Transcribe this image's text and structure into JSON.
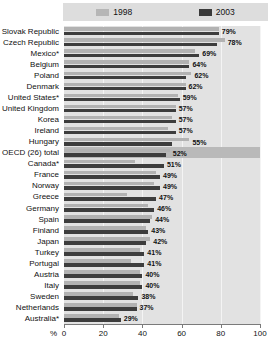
{
  "legend": {
    "entries": [
      {
        "label": "1998",
        "color": "#b2b2b2",
        "icon": "legend-swatch-1998"
      },
      {
        "label": "2003",
        "color": "#3d3d3d",
        "icon": "legend-swatch-2003"
      }
    ]
  },
  "axis": {
    "unit_symbol": "%",
    "ticks": [
      "0",
      "20",
      "40",
      "60",
      "80",
      "100"
    ],
    "tick_values": [
      0,
      20,
      40,
      60,
      80,
      100
    ]
  },
  "chart_data": {
    "type": "bar",
    "orientation": "horizontal",
    "title": "",
    "subtitle": "",
    "xlabel": "%",
    "ylabel": "",
    "xlim": [
      0,
      100
    ],
    "grid": true,
    "legend_position": "top",
    "categories": [
      "Slovak Republic",
      "Czech Republic",
      "Mexico*",
      "Belgium",
      "Poland",
      "Denmark",
      "United States*",
      "United Kingdom",
      "Korea",
      "Ireland",
      "Hungary",
      "OECD (26) total",
      "Canada*",
      "France",
      "Norway",
      "Greece",
      "Germany",
      "Spain",
      "Finland",
      "Japan",
      "Turkey",
      "Portugal",
      "Austria",
      "Italy",
      "Sweden",
      "Netherlands",
      "Australia*"
    ],
    "highlight_category": "OECD (26) total",
    "series": [
      {
        "name": "1998",
        "color": "#b2b2b2",
        "values": [
          79,
          82,
          67,
          64,
          65,
          62,
          58,
          57,
          55,
          53,
          64,
          54,
          36,
          47,
          46,
          32,
          43,
          45,
          42,
          44,
          39,
          34,
          39,
          39,
          35,
          37,
          28
        ]
      },
      {
        "name": "2003",
        "color": "#3d3d3d",
        "values": [
          79,
          78,
          69,
          64,
          62,
          62,
          59,
          57,
          57,
          57,
          55,
          52,
          51,
          49,
          49,
          47,
          46,
          44,
          43,
          42,
          41,
          41,
          40,
          40,
          38,
          37,
          29
        ]
      }
    ],
    "data_labels": [
      "79%",
      "78%",
      "69%",
      "64%",
      "62%",
      "62%",
      "59%",
      "57%",
      "57%",
      "57%",
      "55%",
      "52%",
      "51%",
      "49%",
      "49%",
      "47%",
      "46%",
      "44%",
      "43%",
      "42%",
      "41%",
      "41%",
      "40%",
      "40%",
      "38%",
      "37%",
      "29%"
    ]
  }
}
